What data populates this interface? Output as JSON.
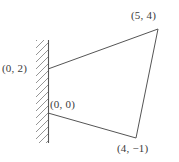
{
  "figure": {
    "background_color": "#ffffff",
    "line_color": "#555555",
    "hatch_color": "#8a8a8a",
    "text_color": "#3a3a3a",
    "wall": {
      "name": "hatched-wall",
      "orientation": "vertical",
      "hatch_direction": "up-right",
      "x_px": 48,
      "y_top_px": 40,
      "y_bottom_px": 143
    },
    "labels": {
      "origin": "(0, 0)",
      "top_left": "(0, 2)",
      "top_right": "(5, 4)",
      "bottom_right": "(4, −1)"
    },
    "vertices": [
      {
        "name": "top-left-vertex",
        "label": "(0, 2)",
        "coord": [
          0,
          2
        ],
        "px": [
          48,
          69
        ]
      },
      {
        "name": "top-right-vertex",
        "label": "(5, 4)",
        "coord": [
          5,
          4
        ],
        "px": [
          158,
          29
        ]
      },
      {
        "name": "bottom-right-vertex",
        "label": "(4, −1)",
        "coord": [
          4,
          -1
        ],
        "px": [
          136,
          138
        ]
      },
      {
        "name": "bottom-left-vertex",
        "label": "(0, 0)",
        "coord": [
          0,
          0
        ],
        "px": [
          48,
          113
        ]
      }
    ],
    "edges": [
      {
        "name": "edge-top",
        "from": "(0, 2)",
        "to": "(5, 4)"
      },
      {
        "name": "edge-right",
        "from": "(5, 4)",
        "to": "(4, −1)"
      },
      {
        "name": "edge-bottom",
        "from": "(4, −1)",
        "to": "(0, 0)"
      },
      {
        "name": "edge-left",
        "from": "(0, 0)",
        "to": "(0, 2)"
      }
    ]
  }
}
